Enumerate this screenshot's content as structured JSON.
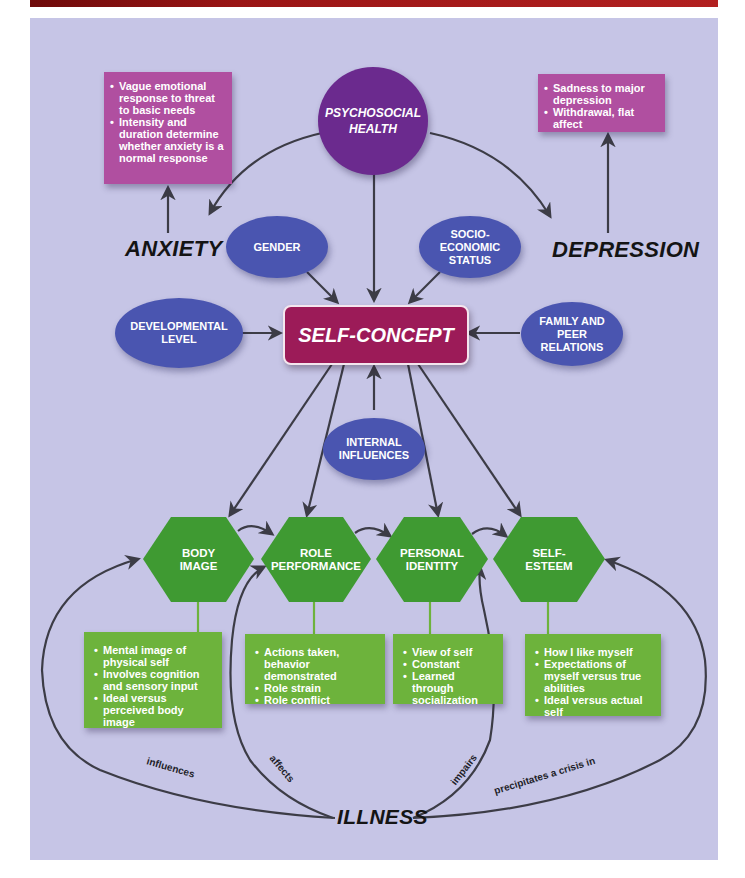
{
  "diagram": {
    "colors": {
      "header_bar": "#9a1515",
      "panel_background": "#c6c5e6",
      "psychosocial_circle": "#6b2a8e",
      "influence_ellipse": "#4a55b0",
      "self_concept_box": "#9c1b58",
      "symptom_box": "#b04fa0",
      "component_hexagon": "#3f9a32",
      "component_detail_box": "#6db33c",
      "arrow": "#3c3c46"
    },
    "central_node": {
      "label": "SELF-CONCEPT"
    },
    "top_node": {
      "label_line1": "PSYCHOSOCIAL",
      "label_line2": "HEALTH"
    },
    "conditions": {
      "anxiety": {
        "label": "ANXIETY",
        "details": [
          "Vague emotional response to threat to basic needs",
          "Intensity and duration determine whether anxiety is a normal response"
        ]
      },
      "depression": {
        "label": "DEPRESSION",
        "details": [
          "Sadness to major depression",
          "Withdrawal, flat affect"
        ]
      }
    },
    "influences": {
      "gender": "GENDER",
      "socioeconomic": {
        "line1": "SOCIO-",
        "line2": "ECONOMIC",
        "line3": "STATUS"
      },
      "developmental": {
        "line1": "DEVELOPMENTAL",
        "line2": "LEVEL"
      },
      "family": {
        "line1": "FAMILY AND",
        "line2": "PEER",
        "line3": "RELATIONS"
      },
      "internal": {
        "line1": "INTERNAL",
        "line2": "INFLUENCES"
      }
    },
    "components": [
      {
        "line1": "BODY",
        "line2": "IMAGE",
        "details": [
          "Mental image of physical self",
          "Involves cognition and sensory input",
          "Ideal versus perceived body image"
        ]
      },
      {
        "line1": "ROLE",
        "line2": "PERFORMANCE",
        "details": [
          "Actions taken, behavior demonstrated",
          "Role strain",
          "Role conflict"
        ]
      },
      {
        "line1": "PERSONAL",
        "line2": "IDENTITY",
        "details": [
          "View of self",
          "Constant",
          "Learned through socialization"
        ]
      },
      {
        "line1": "SELF-",
        "line2": "ESTEEM",
        "details": [
          "How I like myself",
          "Expectations of myself versus true abilities",
          "Ideal versus actual self"
        ]
      }
    ],
    "illness": {
      "label": "ILLNESS",
      "edges": [
        "influences",
        "affects",
        "impairs",
        "precipitates a crisis in"
      ]
    }
  }
}
